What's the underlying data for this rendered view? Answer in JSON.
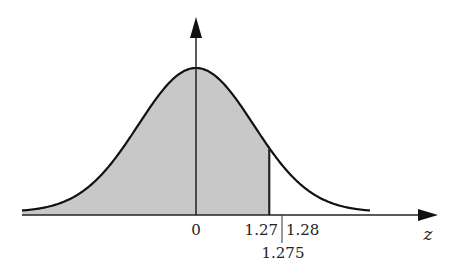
{
  "diagram": {
    "title": "",
    "axis_label": "z",
    "tick_labels": {
      "zero": "0",
      "left_bound": "1.27",
      "right_bound": "1.28",
      "midpoint": "1.275"
    },
    "colors": {
      "shade": "#c8c8c8",
      "curve": "#111111",
      "axis": "#222222"
    }
  },
  "chart_data": {
    "type": "area",
    "xlabel": "z",
    "ylabel": "",
    "distribution": "standard normal",
    "shaded_region": {
      "from": "-inf",
      "to": 1.275
    },
    "reference_lines": [
      {
        "z": 0,
        "style": "solid"
      },
      {
        "z": 1.27,
        "style": "solid"
      },
      {
        "z": 1.275,
        "style": "dashed"
      },
      {
        "z": 1.28,
        "style": "solid"
      }
    ],
    "tick_labels": [
      "0",
      "1.27",
      "1.28",
      "1.275"
    ],
    "grid": false
  }
}
